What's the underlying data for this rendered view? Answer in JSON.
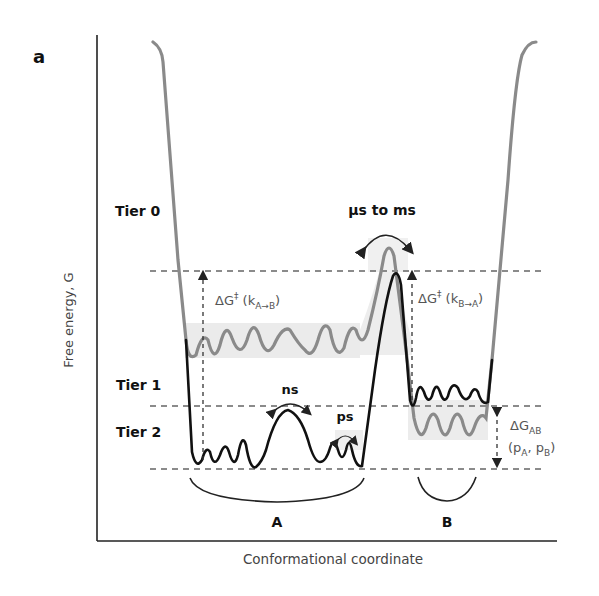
{
  "panel_label": "a",
  "axes": {
    "y_label": "Free energy, G",
    "x_label": "Conformational coordinate"
  },
  "tiers": [
    {
      "label": "Tier 0"
    },
    {
      "label": "Tier 1"
    },
    {
      "label": "Tier 2"
    }
  ],
  "timescales": {
    "tier0": "μs to ms",
    "tier1": "ns",
    "tier2": "ps"
  },
  "barriers": {
    "a_to_b": {
      "prefix": "ΔG",
      "sup": "‡",
      "rate_open": " (k",
      "sub": "A→B",
      "close": ")"
    },
    "b_to_a": {
      "prefix": "ΔG",
      "sup": "‡",
      "rate_open": " (k",
      "sub": "B→A",
      "close": ")"
    }
  },
  "energy_difference": {
    "prefix": "ΔG",
    "sub": "AB",
    "pop_open": "(p",
    "pop_a_sub": "A",
    "comma": ", p",
    "pop_b_sub": "B",
    "pop_close": ")"
  },
  "states": [
    {
      "label": "A"
    },
    {
      "label": "B"
    }
  ],
  "colors": {
    "tier0_curve": "#8a8a8a",
    "tier1_curve": "#111111",
    "band_shade": "#e6e6e6",
    "dashed": "#666666"
  }
}
